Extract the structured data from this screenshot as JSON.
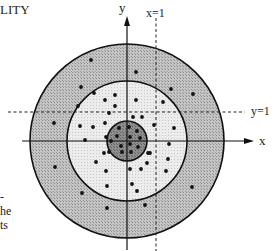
{
  "header": {
    "title_fragment": "LITY"
  },
  "axes": {
    "x_label": "x",
    "y_label": "y",
    "line_x1_label": "x=1",
    "line_y1_label": "y=1"
  },
  "caption_fragments": [
    "-",
    "he",
    "ts"
  ],
  "geometry": {
    "center": [
      127,
      141
    ],
    "outer_radius": 97,
    "middle_radius": 60,
    "inner_radius": 20,
    "dashed_x1": 156,
    "dashed_y1": 112
  },
  "colors": {
    "outer_ring": "#bdbdbd",
    "middle_ring": "#e6e6e6",
    "inner_disk": "#8a8a8a",
    "stroke": "#111111",
    "dot": "#111111"
  },
  "points": {
    "outer_ring": [
      [
        91,
        60
      ],
      [
        136,
        72
      ],
      [
        81,
        87
      ],
      [
        171,
        89
      ],
      [
        193,
        94
      ],
      [
        54,
        123
      ],
      [
        55,
        167
      ],
      [
        192,
        187
      ],
      [
        82,
        193
      ],
      [
        107,
        208
      ],
      [
        145,
        205
      ]
    ],
    "middle_ring": [
      [
        94,
        93
      ],
      [
        115,
        95
      ],
      [
        105,
        100
      ],
      [
        136,
        100
      ],
      [
        163,
        102
      ],
      [
        115,
        106
      ],
      [
        78,
        106
      ],
      [
        109,
        113
      ],
      [
        133,
        117
      ],
      [
        142,
        117
      ],
      [
        105,
        123
      ],
      [
        80,
        126
      ],
      [
        93,
        127
      ],
      [
        154,
        125
      ],
      [
        174,
        128
      ],
      [
        85,
        140
      ],
      [
        106,
        137
      ],
      [
        169,
        144
      ],
      [
        104,
        153
      ],
      [
        148,
        153
      ],
      [
        150,
        153
      ],
      [
        96,
        162
      ],
      [
        147,
        163
      ],
      [
        168,
        159
      ],
      [
        106,
        171
      ],
      [
        130,
        169
      ],
      [
        141,
        169
      ],
      [
        166,
        171
      ],
      [
        132,
        184
      ],
      [
        107,
        186
      ],
      [
        137,
        191
      ]
    ],
    "inner_disk": [
      [
        119,
        128
      ],
      [
        129,
        127
      ],
      [
        137,
        131
      ],
      [
        117,
        136
      ],
      [
        130,
        137
      ],
      [
        140,
        138
      ],
      [
        111,
        141
      ],
      [
        121,
        146
      ],
      [
        130,
        144
      ],
      [
        138,
        147
      ],
      [
        122,
        152
      ],
      [
        131,
        152
      ],
      [
        109,
        152
      ]
    ]
  }
}
